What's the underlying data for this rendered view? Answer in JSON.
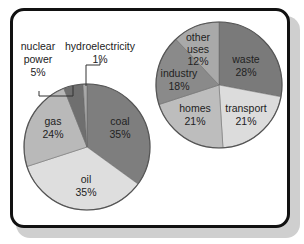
{
  "chart_data": [
    {
      "type": "pie",
      "title": "",
      "categories": [
        "coal",
        "oil",
        "gas",
        "nuclear power",
        "hydroelectricity"
      ],
      "values": [
        35,
        35,
        24,
        5,
        1
      ],
      "colors": [
        "#7e7e7e",
        "#dedede",
        "#b9b9b9",
        "#6f6f6f",
        "#a8a8a8"
      ],
      "labels": {
        "coal": {
          "name": "coal",
          "pct": "35%"
        },
        "oil": {
          "name": "oil",
          "pct": "35%"
        },
        "gas": {
          "name": "gas",
          "pct": "24%"
        },
        "nuclear": {
          "name1": "nuclear",
          "name2": "power",
          "pct": "5%"
        },
        "hydro": {
          "name": "hydroelectricity",
          "pct": "1%"
        }
      },
      "start_angle": "12 o'clock",
      "direction": "clockwise"
    },
    {
      "type": "pie",
      "title": "",
      "categories": [
        "waste",
        "transport",
        "homes",
        "industry",
        "other uses"
      ],
      "values": [
        28,
        21,
        21,
        18,
        12
      ],
      "colors": [
        "#7a7a7a",
        "#dcdcdc",
        "#bdbdbd",
        "#8a8a8a",
        "#a9a9a9"
      ],
      "labels": {
        "waste": {
          "name": "waste",
          "pct": "28%"
        },
        "transport": {
          "name": "transport",
          "pct": "21%"
        },
        "homes": {
          "name": "homes",
          "pct": "21%"
        },
        "industry": {
          "name": "industry",
          "pct": "18%"
        },
        "other": {
          "name1": "other",
          "name2": "uses",
          "pct": "12%"
        }
      },
      "start_angle": "12 o'clock",
      "direction": "clockwise"
    }
  ]
}
